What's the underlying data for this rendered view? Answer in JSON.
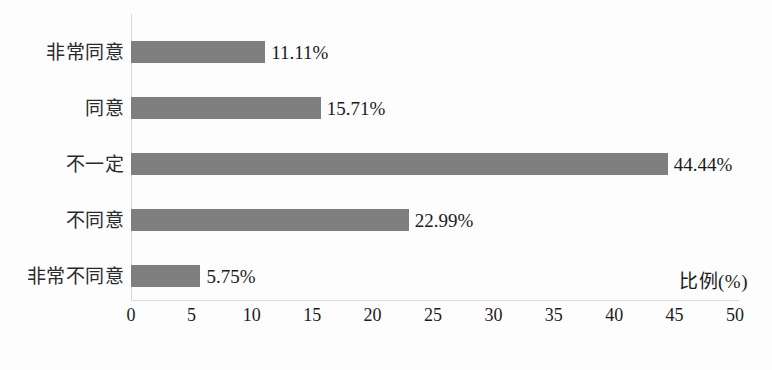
{
  "chart_data": {
    "type": "bar",
    "orientation": "horizontal",
    "title": "",
    "xlabel": "比例(%)",
    "ylabel": "",
    "xlim": [
      0,
      50
    ],
    "xticks": [
      0,
      5,
      10,
      15,
      20,
      25,
      30,
      35,
      40,
      45,
      50
    ],
    "xtick_labels": [
      "0",
      "5",
      "10",
      "15",
      "20",
      "25",
      "30",
      "35",
      "40",
      "45",
      "50"
    ],
    "grid": false,
    "legend": false,
    "bar_color": "#7f7f7f",
    "categories": [
      "非常同意",
      "同意",
      "不一定",
      "不同意",
      "非常不同意"
    ],
    "values": [
      11.11,
      15.71,
      44.44,
      22.99,
      5.75
    ],
    "value_labels": [
      "11.11%",
      "15.71%",
      "44.44%",
      "22.99%",
      "5.75%"
    ],
    "bars": [
      {
        "category": "非常同意",
        "value": 11.11,
        "label": "11.11%"
      },
      {
        "category": "同意",
        "value": 15.71,
        "label": "15.71%"
      },
      {
        "category": "不一定",
        "value": 44.44,
        "label": "44.44%"
      },
      {
        "category": "不同意",
        "value": 22.99,
        "label": "22.99%"
      },
      {
        "category": "非常不同意",
        "value": 5.75,
        "label": "5.75%"
      }
    ]
  }
}
